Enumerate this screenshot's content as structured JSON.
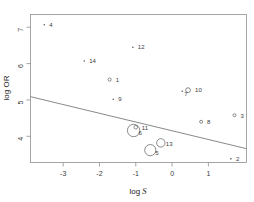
{
  "chart_data": {
    "type": "scatter",
    "title": "",
    "subtitle": "",
    "xlabel": "log S",
    "xlabel_plain": "log",
    "xlabel_italic": "S",
    "ylabel": "log OR",
    "xlim": [
      -3.9,
      2.05
    ],
    "ylim": [
      3.28,
      7.35
    ],
    "xticks": [
      -3,
      -2,
      -1,
      0,
      1
    ],
    "xticklabels": [
      "-3",
      "-2",
      "-1",
      "0",
      "1"
    ],
    "yticks": [
      7,
      6,
      5,
      4
    ],
    "yticklabels": [
      "7",
      "6",
      "5",
      "4"
    ],
    "grid": false,
    "legend": "none",
    "marker_note": "bubble sizes proportional to study weight; labels are study numbers",
    "points": [
      {
        "label": "4",
        "x": -3.52,
        "y": 7.07,
        "size": 0.9,
        "marker": "dot",
        "label_dx": 5,
        "label_dy": 2.0
      },
      {
        "label": "12",
        "x": -1.08,
        "y": 6.45,
        "size": 0.9,
        "marker": "dot",
        "label_dx": 5,
        "label_dy": 2.0
      },
      {
        "label": "14",
        "x": -2.42,
        "y": 6.07,
        "size": 0.9,
        "marker": "dot",
        "label_dx": 5,
        "label_dy": 2.0
      },
      {
        "label": "1",
        "x": -1.72,
        "y": 5.56,
        "size": 1.6,
        "marker": "circle",
        "label_dx": 6,
        "label_dy": 2.6
      },
      {
        "label": "10",
        "x": 0.44,
        "y": 5.27,
        "size": 2.4,
        "marker": "circle",
        "label_dx": 7,
        "label_dy": 1.6
      },
      {
        "label": "7",
        "x": 0.28,
        "y": 5.24,
        "size": 0.9,
        "marker": "dot",
        "label_dx": 2,
        "label_dy": 5.0
      },
      {
        "label": "9",
        "x": -1.62,
        "y": 5.02,
        "size": 0.9,
        "marker": "dot",
        "label_dx": 5,
        "label_dy": 2.0
      },
      {
        "label": "3",
        "x": 1.72,
        "y": 4.58,
        "size": 1.5,
        "marker": "circle",
        "label_dx": 6,
        "label_dy": 2.6
      },
      {
        "label": "8",
        "x": 0.8,
        "y": 4.4,
        "size": 1.5,
        "marker": "circle",
        "label_dx": 6,
        "label_dy": 2.6
      },
      {
        "label": "11",
        "x": -1.0,
        "y": 4.25,
        "size": 1.8,
        "marker": "circle",
        "label_dx": 6,
        "label_dy": 2.6
      },
      {
        "label": "6",
        "x": -1.06,
        "y": 4.16,
        "size": 6.2,
        "marker": "circle",
        "label_dx": 5,
        "label_dy": 4.6
      },
      {
        "label": "13",
        "x": -0.31,
        "y": 3.82,
        "size": 4.2,
        "marker": "circle",
        "label_dx": 5,
        "label_dy": 3.2
      },
      {
        "label": "5",
        "x": -0.6,
        "y": 3.62,
        "size": 5.6,
        "marker": "circle",
        "label_dx": 5,
        "label_dy": 4.4
      },
      {
        "label": "2",
        "x": 1.62,
        "y": 3.38,
        "size": 0.9,
        "marker": "dot",
        "label_dx": 5,
        "label_dy": 2.0
      }
    ],
    "fit_line": {
      "name": "regression line",
      "x_start": -3.9,
      "y_start": 5.09,
      "x_end": 2.05,
      "y_end": 3.66
    }
  }
}
